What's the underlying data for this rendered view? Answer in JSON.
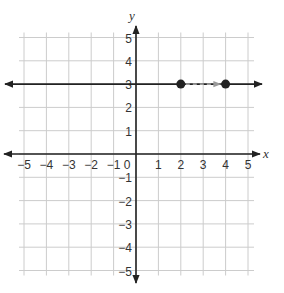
{
  "chart_data": {
    "type": "scatter",
    "title": "",
    "xlabel": "x",
    "ylabel": "y",
    "xlim": [
      -5,
      5
    ],
    "ylim": [
      -5,
      5
    ],
    "grid": true,
    "x_ticks": [
      "-5",
      "-4",
      "-3",
      "-2",
      "-1",
      "0",
      "1",
      "2",
      "3",
      "4",
      "5"
    ],
    "y_ticks": [
      "5",
      "4",
      "3",
      "2",
      "1",
      "-1",
      "-2",
      "-3",
      "-4",
      "-5"
    ],
    "lines": [
      {
        "name": "line y=3",
        "equation": "y = 3",
        "style": "solid",
        "color": "#222222",
        "arrows": "both"
      }
    ],
    "points": [
      {
        "x": 2,
        "y": 3
      },
      {
        "x": 4,
        "y": 3
      }
    ],
    "annotations": [
      {
        "type": "dashed-arrow",
        "from": [
          2,
          3
        ],
        "to": [
          4,
          3
        ],
        "color": "#999999"
      }
    ]
  },
  "colors": {
    "grid": "#cccccc",
    "axis": "#222222",
    "line": "#222222",
    "point": "#222222",
    "translation_arrow": "#9a9a9a"
  }
}
